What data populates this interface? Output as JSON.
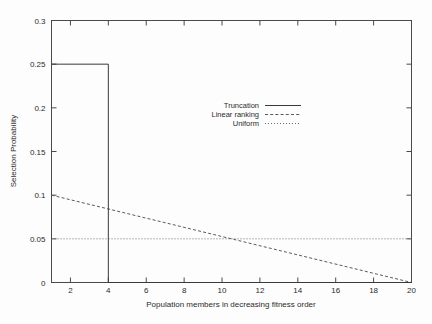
{
  "chart_data": {
    "type": "line",
    "title": "",
    "xlabel": "Population members in decreasing fitness order",
    "ylabel": "Selection Probability",
    "xlim": [
      1,
      20
    ],
    "ylim": [
      0,
      0.3
    ],
    "grid": false,
    "legend_position": "center",
    "xticks": [
      2,
      4,
      6,
      8,
      10,
      12,
      14,
      16,
      18,
      20
    ],
    "xtick_labels": [
      "2",
      "4",
      "6",
      "8",
      "10",
      "12",
      "14",
      "16",
      "18",
      "20"
    ],
    "yticks": [
      0,
      0.05,
      0.1,
      0.15,
      0.2,
      0.25,
      0.3
    ],
    "ytick_labels": [
      "0",
      "0.05",
      "0.1",
      "0.15",
      "0.2",
      "0.25",
      "0.3"
    ],
    "series": [
      {
        "name": "Truncation",
        "style": "solid",
        "x": [
          1,
          4,
          4,
          20
        ],
        "values": [
          0.25,
          0.25,
          0,
          0
        ]
      },
      {
        "name": "Linear ranking",
        "style": "dashed",
        "x": [
          1,
          20
        ],
        "values": [
          0.1,
          0
        ]
      },
      {
        "name": "Uniform",
        "style": "dotted",
        "x": [
          1,
          20
        ],
        "values": [
          0.05,
          0.05
        ]
      }
    ],
    "legend": [
      {
        "label": "Truncation",
        "style": "solid"
      },
      {
        "label": "Linear ranking",
        "style": "dashed"
      },
      {
        "label": "Uniform",
        "style": "dotted"
      }
    ],
    "colors": {
      "background": "#fdfdfd",
      "axis": "#4a4a4a",
      "truncation": "#3a3a3a",
      "linear_ranking": "#5a5a5a",
      "uniform": "#6e6e6e",
      "text": "#2b2b2b"
    }
  }
}
